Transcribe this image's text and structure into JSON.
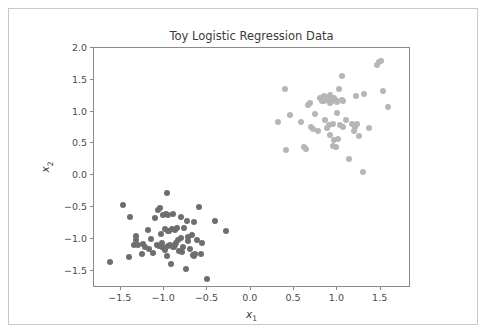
{
  "figure": {
    "background": "#ffffff",
    "frame_color": "#c9c9c9",
    "axes_spine_color": "#8a8a8a",
    "width": 490,
    "height": 334
  },
  "chart_data": {
    "type": "scatter",
    "title": "Toy Logistic Regression Data",
    "xlabel": "x",
    "xlabel_sub": "1",
    "ylabel": "x",
    "ylabel_sub": "2",
    "xlim": [
      -1.81,
      1.85
    ],
    "ylim": [
      -1.77,
      2.0
    ],
    "grid": false,
    "legend": null,
    "xticks": [
      -1.5,
      -1.0,
      -0.5,
      0.0,
      0.5,
      1.0,
      1.5
    ],
    "xticklabels": [
      "−1.5",
      "−1.0",
      "−0.5",
      "0.0",
      "0.5",
      "1.0",
      "1.5"
    ],
    "yticks": [
      -1.5,
      -1.0,
      -0.5,
      0.0,
      0.5,
      1.0,
      1.5,
      2.0
    ],
    "yticklabels": [
      "−1.5",
      "−1.0",
      "−0.5",
      "0.0",
      "0.5",
      "1.0",
      "1.5",
      "2.0"
    ],
    "marker_size_px": 6,
    "series": [
      {
        "name": "class-0",
        "color": "#6e6e6e",
        "points": [
          [
            -1.63,
            -1.36
          ],
          [
            -1.47,
            -0.46
          ],
          [
            -1.41,
            -1.29
          ],
          [
            -1.39,
            -0.66
          ],
          [
            -1.35,
            -1.09
          ],
          [
            -1.33,
            -0.95
          ],
          [
            -1.32,
            -1.02
          ],
          [
            -1.3,
            -1.1
          ],
          [
            -1.26,
            -1.24
          ],
          [
            -1.24,
            -1.08
          ],
          [
            -1.22,
            -1.13
          ],
          [
            -1.19,
            -0.86
          ],
          [
            -1.17,
            -1.16
          ],
          [
            -1.15,
            -1.0
          ],
          [
            -1.13,
            -1.22
          ],
          [
            -1.11,
            -0.67
          ],
          [
            -1.08,
            -1.09
          ],
          [
            -1.07,
            -0.54
          ],
          [
            -1.06,
            -1.11
          ],
          [
            -1.05,
            -0.52
          ],
          [
            -1.04,
            -0.92
          ],
          [
            -1.03,
            -1.12
          ],
          [
            -1.02,
            -1.06
          ],
          [
            -1.01,
            -0.62
          ],
          [
            -1.0,
            -1.14
          ],
          [
            -0.99,
            -0.85
          ],
          [
            -0.99,
            -1.18
          ],
          [
            -0.98,
            -0.6
          ],
          [
            -0.97,
            -0.28
          ],
          [
            -0.97,
            -1.26
          ],
          [
            -0.96,
            -0.88
          ],
          [
            -0.95,
            -1.11
          ],
          [
            -0.95,
            -0.62
          ],
          [
            -0.94,
            -0.87
          ],
          [
            -0.93,
            -1.09
          ],
          [
            -0.92,
            -1.4
          ],
          [
            -0.91,
            -0.84
          ],
          [
            -0.9,
            -1.13
          ],
          [
            -0.9,
            -0.6
          ],
          [
            -0.89,
            -1.12
          ],
          [
            -0.88,
            -0.86
          ],
          [
            -0.87,
            -1.1
          ],
          [
            -0.86,
            -1.07
          ],
          [
            -0.85,
            -0.83
          ],
          [
            -0.84,
            -1.02
          ],
          [
            -0.83,
            -1.19
          ],
          [
            -0.81,
            -0.65
          ],
          [
            -0.8,
            -0.99
          ],
          [
            -0.79,
            -1.21
          ],
          [
            -0.78,
            -1.12
          ],
          [
            -0.77,
            -0.82
          ],
          [
            -0.75,
            -1.47
          ],
          [
            -0.74,
            -0.71
          ],
          [
            -0.73,
            -0.97
          ],
          [
            -0.72,
            -1.03
          ],
          [
            -0.7,
            -1.16
          ],
          [
            -0.68,
            -0.93
          ],
          [
            -0.67,
            -1.25
          ],
          [
            -0.66,
            -1.27
          ],
          [
            -0.65,
            -0.73
          ],
          [
            -0.64,
            -1.23
          ],
          [
            -0.62,
            -1.02
          ],
          [
            -0.6,
            -0.49
          ],
          [
            -0.58,
            -1.24
          ],
          [
            -0.56,
            -1.07
          ],
          [
            -0.5,
            -1.63
          ],
          [
            -0.41,
            -0.71
          ],
          [
            -0.29,
            -0.87
          ]
        ]
      },
      {
        "name": "class-1",
        "color": "#b6b6b6",
        "points": [
          [
            0.31,
            0.83
          ],
          [
            0.39,
            1.35
          ],
          [
            0.41,
            0.39
          ],
          [
            0.45,
            0.95
          ],
          [
            0.58,
            0.83
          ],
          [
            0.62,
            0.44
          ],
          [
            0.64,
            0.42
          ],
          [
            0.66,
            1.11
          ],
          [
            0.68,
            1.13
          ],
          [
            0.7,
            0.76
          ],
          [
            0.72,
            0.73
          ],
          [
            0.74,
            0.96
          ],
          [
            0.78,
            0.69
          ],
          [
            0.8,
            1.21
          ],
          [
            0.82,
            1.17
          ],
          [
            0.84,
            1.24
          ],
          [
            0.85,
            1.16
          ],
          [
            0.86,
            0.87
          ],
          [
            0.88,
            1.22
          ],
          [
            0.89,
            1.19
          ],
          [
            0.9,
            0.79
          ],
          [
            0.91,
            1.26
          ],
          [
            0.92,
            0.64
          ],
          [
            0.93,
            1.18
          ],
          [
            0.94,
            1.17
          ],
          [
            0.95,
            0.81
          ],
          [
            0.95,
            0.46
          ],
          [
            0.96,
            1.22
          ],
          [
            0.96,
            0.55
          ],
          [
            0.97,
            1.19
          ],
          [
            0.98,
            0.44
          ],
          [
            0.99,
            1.16
          ],
          [
            1.0,
            0.98
          ],
          [
            1.0,
            1.15
          ],
          [
            1.02,
            1.35
          ],
          [
            1.03,
            0.79
          ],
          [
            1.05,
            1.56
          ],
          [
            1.06,
            0.76
          ],
          [
            1.1,
            0.87
          ],
          [
            1.13,
            0.25
          ],
          [
            1.17,
            0.8
          ],
          [
            1.19,
            0.69
          ],
          [
            1.2,
            0.76
          ],
          [
            1.22,
            1.25
          ],
          [
            1.23,
            0.8
          ],
          [
            1.25,
            0.62
          ],
          [
            1.29,
            0.05
          ],
          [
            1.31,
            1.28
          ],
          [
            1.46,
            1.74
          ],
          [
            1.48,
            1.78
          ],
          [
            1.5,
            1.79
          ],
          [
            1.53,
            1.33
          ],
          [
            1.58,
            1.08
          ],
          [
            1.37,
            0.74
          ],
          [
            0.88,
            0.75
          ],
          [
            1.05,
            1.18
          ],
          [
            0.87,
            1.2
          ],
          [
            0.92,
            1.13
          ],
          [
            1.07,
            1.16
          ],
          [
            1.01,
            0.57
          ]
        ]
      }
    ]
  }
}
